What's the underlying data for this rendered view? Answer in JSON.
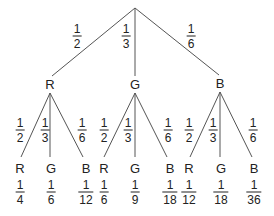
{
  "tree": {
    "root": {
      "x": 135,
      "y": 8
    },
    "level1": [
      {
        "label": "R",
        "x": 50,
        "y": 84,
        "prob": {
          "num": "1",
          "den": "2"
        },
        "prob_pos": {
          "x": 77,
          "y": 36
        }
      },
      {
        "label": "G",
        "x": 135,
        "y": 84,
        "prob": {
          "num": "1",
          "den": "3"
        },
        "prob_pos": {
          "x": 126,
          "y": 36
        }
      },
      {
        "label": "B",
        "x": 220,
        "y": 83,
        "prob": {
          "num": "1",
          "den": "6"
        },
        "prob_pos": {
          "x": 191,
          "y": 36
        }
      }
    ],
    "level2": [
      {
        "label": "R",
        "x": 20,
        "y": 168,
        "prob": {
          "num": "1",
          "den": "2"
        },
        "prob_pos": {
          "x": 20,
          "y": 130
        },
        "result": {
          "num": "1",
          "den": "4"
        },
        "result_pos": {
          "x": 20,
          "y": 192
        }
      },
      {
        "label": "G",
        "x": 51,
        "y": 168,
        "prob": {
          "num": "1",
          "den": "3"
        },
        "prob_pos": {
          "x": 45,
          "y": 130
        },
        "result": {
          "num": "1",
          "den": "6"
        },
        "result_pos": {
          "x": 51,
          "y": 192
        }
      },
      {
        "label": "B",
        "x": 86,
        "y": 168,
        "prob": {
          "num": "1",
          "den": "6"
        },
        "prob_pos": {
          "x": 82,
          "y": 130
        },
        "result": {
          "num": "1",
          "den": "12"
        },
        "result_pos": {
          "x": 86,
          "y": 192
        }
      },
      {
        "label": "R",
        "x": 104,
        "y": 168,
        "prob": {
          "num": "1",
          "den": "2"
        },
        "prob_pos": {
          "x": 104,
          "y": 130
        },
        "result": {
          "num": "1",
          "den": "6"
        },
        "result_pos": {
          "x": 104,
          "y": 192
        }
      },
      {
        "label": "G",
        "x": 135,
        "y": 168,
        "prob": {
          "num": "1",
          "den": "3"
        },
        "prob_pos": {
          "x": 128,
          "y": 130
        },
        "result": {
          "num": "1",
          "den": "9"
        },
        "result_pos": {
          "x": 135,
          "y": 192
        }
      },
      {
        "label": "B",
        "x": 170,
        "y": 168,
        "prob": {
          "num": "1",
          "den": "6"
        },
        "prob_pos": {
          "x": 168,
          "y": 130
        },
        "result": {
          "num": "1",
          "den": "18"
        },
        "result_pos": {
          "x": 170,
          "y": 192
        }
      },
      {
        "label": "R",
        "x": 189,
        "y": 168,
        "prob": {
          "num": "1",
          "den": "2"
        },
        "prob_pos": {
          "x": 189,
          "y": 130
        },
        "result": {
          "num": "1",
          "den": "12"
        },
        "result_pos": {
          "x": 189,
          "y": 192
        }
      },
      {
        "label": "G",
        "x": 221,
        "y": 168,
        "prob": {
          "num": "1",
          "den": "3"
        },
        "prob_pos": {
          "x": 213,
          "y": 130
        },
        "result": {
          "num": "1",
          "den": "18"
        },
        "result_pos": {
          "x": 221,
          "y": 192
        }
      },
      {
        "label": "B",
        "x": 254,
        "y": 168,
        "prob": {
          "num": "1",
          "den": "6"
        },
        "prob_pos": {
          "x": 253,
          "y": 130
        },
        "result": {
          "num": "1",
          "den": "36"
        },
        "result_pos": {
          "x": 254,
          "y": 192
        }
      }
    ]
  },
  "colors": {
    "line": "#555555",
    "text": "#222222",
    "background": "#ffffff"
  }
}
